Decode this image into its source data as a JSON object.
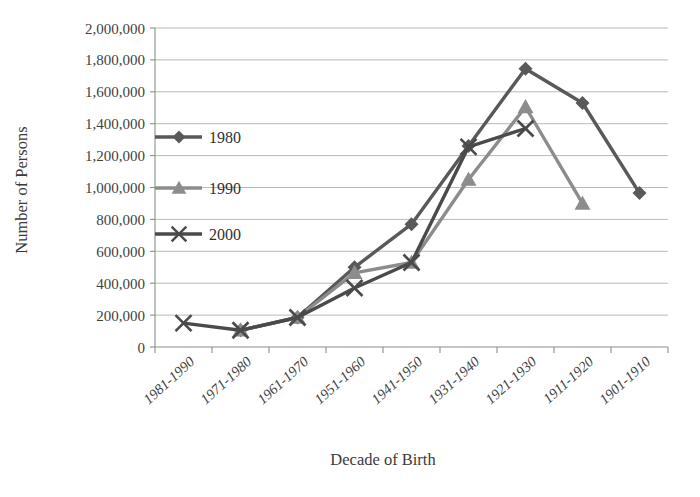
{
  "chart_data": {
    "type": "line",
    "title": "",
    "xlabel": "Decade of Birth",
    "ylabel": "Number of Persons",
    "categories": [
      "1981-1990",
      "1971-1980",
      "1961-1970",
      "1951-1960",
      "1941-1950",
      "1931-1940",
      "1921-1930",
      "1911-1920",
      "1901-1910"
    ],
    "ylim": [
      0,
      2000000
    ],
    "ytick_values": [
      0,
      200000,
      400000,
      600000,
      800000,
      1000000,
      1200000,
      1400000,
      1600000,
      1800000,
      2000000
    ],
    "ytick_labels": [
      "0",
      "200,000",
      "400,000",
      "600,000",
      "800,000",
      "1,000,000",
      "1,200,000",
      "1,400,000",
      "1,600,000",
      "1,800,000",
      "2,000,000"
    ],
    "grid": true,
    "legend_position": "inside-upper-left",
    "series": [
      {
        "name": "1980",
        "marker": "diamond",
        "color": "#595959",
        "values": [
          null,
          105000,
          185000,
          500000,
          770000,
          1260000,
          1745000,
          1530000,
          965000
        ]
      },
      {
        "name": "1990",
        "marker": "triangle",
        "color": "#8c8c8c",
        "values": [
          null,
          105000,
          185000,
          465000,
          530000,
          1050000,
          1505000,
          900000,
          null
        ]
      },
      {
        "name": "2000",
        "marker": "cross",
        "color": "#4a4a4a",
        "values": [
          150000,
          105000,
          185000,
          370000,
          530000,
          1255000,
          1370000,
          null,
          null
        ]
      }
    ]
  },
  "legend": {
    "entries": [
      {
        "label": "1980"
      },
      {
        "label": "1990"
      },
      {
        "label": "2000"
      }
    ]
  },
  "axes": {
    "x_title": "Decade of Birth",
    "y_title": "Number of Persons"
  }
}
